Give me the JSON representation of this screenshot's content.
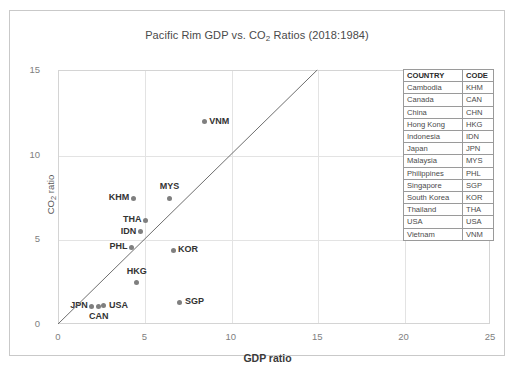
{
  "chart_data": {
    "type": "scatter",
    "title": "Pacific Rim GDP vs. CO2 Ratios (2018:1984)",
    "title_main": "Pacific Rim GDP vs. CO",
    "title_sub": "2",
    "title_tail": " Ratios (2018:1984)",
    "xlabel": "GDP ratio",
    "ylabel_main": "CO",
    "ylabel_sub": "2",
    "ylabel_tail": " ratio",
    "xlim": [
      0,
      25
    ],
    "ylim": [
      0,
      15
    ],
    "xticks": [
      "0",
      "5",
      "10",
      "15",
      "20",
      "25"
    ],
    "yticks": [
      "0",
      "5",
      "10",
      "15"
    ],
    "grid": true,
    "legend_position": "inside-top-right",
    "reference_line": {
      "name": "y=x diagonal",
      "from": [
        0,
        0
      ],
      "to": [
        15,
        15
      ]
    },
    "points": [
      {
        "code": "VNM",
        "x": 8.4,
        "y": 12.0,
        "label_side": "right"
      },
      {
        "code": "MYS",
        "x": 6.4,
        "y": 7.5,
        "label_side": "above"
      },
      {
        "code": "KHM",
        "x": 4.3,
        "y": 7.5,
        "label_side": "left"
      },
      {
        "code": "THA",
        "x": 5.0,
        "y": 6.2,
        "label_side": "left"
      },
      {
        "code": "IDN",
        "x": 4.7,
        "y": 5.5,
        "label_side": "left"
      },
      {
        "code": "PHL",
        "x": 4.2,
        "y": 4.6,
        "label_side": "left"
      },
      {
        "code": "KOR",
        "x": 6.6,
        "y": 4.4,
        "label_side": "right"
      },
      {
        "code": "HKG",
        "x": 4.5,
        "y": 2.5,
        "label_side": "above"
      },
      {
        "code": "SGP",
        "x": 7.0,
        "y": 1.35,
        "label_side": "right"
      },
      {
        "code": "JPN",
        "x": 1.9,
        "y": 1.1,
        "label_side": "left"
      },
      {
        "code": "CAN",
        "x": 2.3,
        "y": 1.1,
        "label_side": "below"
      },
      {
        "code": "USA",
        "x": 2.6,
        "y": 1.15,
        "label_side": "right"
      },
      {
        "code": "CHN",
        "x": 21.4,
        "y": 5.4,
        "label_side": "right"
      }
    ]
  },
  "legend": {
    "headers": {
      "country": "COUNTRY",
      "code": "CODE"
    },
    "rows": [
      {
        "country": "Cambodia",
        "code": "KHM"
      },
      {
        "country": "Canada",
        "code": "CAN"
      },
      {
        "country": "China",
        "code": "CHN"
      },
      {
        "country": "Hong Kong",
        "code": "HKG"
      },
      {
        "country": "Indonesia",
        "code": "IDN"
      },
      {
        "country": "Japan",
        "code": "JPN"
      },
      {
        "country": "Malaysia",
        "code": "MYS"
      },
      {
        "country": "Philippines",
        "code": "PHL"
      },
      {
        "country": "Singapore",
        "code": "SGP"
      },
      {
        "country": "South Korea",
        "code": "KOR"
      },
      {
        "country": "Thailand",
        "code": "THA"
      },
      {
        "country": "USA",
        "code": "USA"
      },
      {
        "country": "Vietnam",
        "code": "VNM"
      }
    ]
  },
  "colors": {
    "marker": "#7f7f7f",
    "gridline": "#e3e3e3",
    "frame": "#c9c9c9",
    "refline": "#6e6e6e",
    "tick_text": "#808080",
    "label_text": "#333333"
  }
}
